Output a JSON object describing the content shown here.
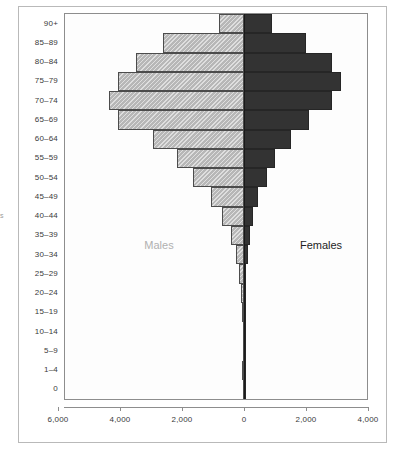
{
  "figure": {
    "edge_caption_fragment": "s",
    "series_labels": {
      "males": "Males",
      "females": "Females"
    },
    "colors": {
      "male_fill": "#b7b7b7",
      "male_border": "#4c4c4c",
      "female_fill": "#333333",
      "female_border": "#262626",
      "axis": "#8d8d8d",
      "frame": "#b9b9b9",
      "text": "#3a3a3a"
    }
  },
  "chart_data": {
    "type": "bar",
    "subtype": "population-pyramid",
    "title": "",
    "xlabel": "",
    "ylabel": "",
    "orientation": "horizontal",
    "grid": false,
    "legend_position": "in-plot",
    "categories": [
      "90+",
      "85–89",
      "80–84",
      "75–79",
      "70–74",
      "65–69",
      "60–64",
      "55–59",
      "50–54",
      "45–49",
      "40–44",
      "35–39",
      "30–34",
      "25–29",
      "20–24",
      "15–19",
      "10–14",
      "5–9",
      "1–4",
      "0"
    ],
    "series": [
      {
        "name": "Males",
        "direction": "left",
        "axis_max": 6000,
        "values": [
          800,
          2600,
          3500,
          4050,
          4350,
          4050,
          2950,
          2150,
          1650,
          1050,
          700,
          420,
          250,
          150,
          90,
          55,
          30,
          20,
          70,
          15
        ]
      },
      {
        "name": "Females",
        "direction": "right",
        "axis_max": 4000,
        "values": [
          900,
          2000,
          2850,
          3130,
          2850,
          2100,
          1500,
          1000,
          750,
          450,
          300,
          200,
          120,
          70,
          45,
          30,
          18,
          12,
          45,
          10
        ]
      }
    ],
    "xaxis": {
      "ticks": [
        {
          "label": "6,000",
          "value": -6000
        },
        {
          "label": "4,000",
          "value": -4000
        },
        {
          "label": "2,000",
          "value": -2000
        },
        {
          "label": "0",
          "value": 0
        },
        {
          "label": "2,000",
          "value": 2000
        },
        {
          "label": "4,000",
          "value": 4000
        }
      ],
      "xlim": [
        -6000,
        4000
      ],
      "units_per_tick": 2000
    }
  }
}
